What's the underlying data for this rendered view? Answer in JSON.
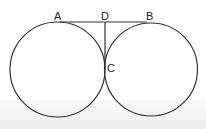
{
  "diagram": {
    "type": "two tangent circles with common tangent line",
    "points": [
      {
        "id": "A",
        "label": "A",
        "x": 57,
        "y": 14
      },
      {
        "id": "D",
        "label": "D",
        "x": 101,
        "y": 14
      },
      {
        "id": "B",
        "label": "B",
        "x": 146,
        "y": 14
      },
      {
        "id": "C",
        "label": "C",
        "x": 107,
        "y": 63
      }
    ],
    "circles": [
      {
        "name": "left-circle",
        "cx": 57.5,
        "cy": 69.5,
        "r": 47.5
      },
      {
        "name": "right-circle",
        "cx": 151,
        "cy": 69.5,
        "r": 46
      }
    ],
    "segments": [
      {
        "name": "AB",
        "from": "A",
        "to": "B"
      },
      {
        "name": "DC",
        "from": "D",
        "to": "C"
      }
    ],
    "colors": {
      "stroke": "#333333",
      "label": "#222222"
    }
  }
}
